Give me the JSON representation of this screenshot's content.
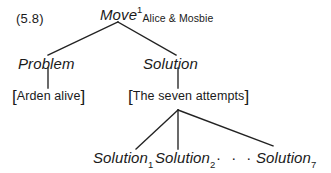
{
  "figure": {
    "equation_label": "(5.8)",
    "type": "tree-diagram",
    "background_color": "#ffffff",
    "line_color": "#222222",
    "text_color": "#1a1a1a"
  },
  "nodes": {
    "root": {
      "label": "Move",
      "superscript": "1",
      "subscript": "Alice & Mosbie",
      "style": "italic"
    },
    "problem": {
      "label": "Problem",
      "style": "italic"
    },
    "solution": {
      "label": "Solution",
      "style": "italic"
    },
    "problem_leaf": {
      "open_bracket": "[",
      "label": "Arden alive",
      "close_bracket": "]",
      "style": "upright"
    },
    "solution_leaf": {
      "open_bracket": "[",
      "label": "The seven attempts",
      "close_bracket": "]",
      "style": "upright"
    },
    "solution_1": {
      "label": "Solution",
      "subscript": "1",
      "style": "italic"
    },
    "solution_2": {
      "label": "Solution",
      "subscript": "2",
      "style": "italic"
    },
    "ellipsis": {
      "label": "· · ·"
    },
    "solution_7": {
      "label": "Solution",
      "subscript": "7",
      "style": "italic"
    }
  },
  "edges": [
    {
      "from": "root",
      "to": "problem",
      "x1": 118,
      "y1": 22,
      "x2": 48,
      "y2": 55
    },
    {
      "from": "root",
      "to": "solution",
      "x1": 118,
      "y1": 22,
      "x2": 176,
      "y2": 55
    },
    {
      "from": "problem",
      "to": "problem_leaf",
      "x1": 48,
      "y1": 68,
      "x2": 48,
      "y2": 88
    },
    {
      "from": "solution",
      "to": "solution_leaf",
      "x1": 178,
      "y1": 68,
      "x2": 178,
      "y2": 88
    },
    {
      "from": "solution_leaf",
      "to": "solution_1",
      "x1": 178,
      "y1": 110,
      "x2": 136,
      "y2": 149
    },
    {
      "from": "solution_leaf",
      "to": "solution_2",
      "x1": 178,
      "y1": 110,
      "x2": 178,
      "y2": 149
    },
    {
      "from": "solution_leaf",
      "to": "solution_7",
      "x1": 178,
      "y1": 110,
      "x2": 273,
      "y2": 146
    }
  ]
}
